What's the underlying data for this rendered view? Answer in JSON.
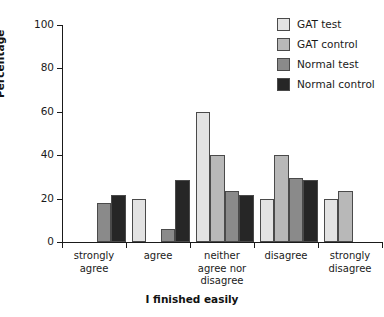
{
  "chart_data": {
    "type": "bar",
    "title": "",
    "xlabel": "I finished easily",
    "ylabel": "Percentage",
    "categories": [
      "strongly agree",
      "agree",
      "neither agree nor disagree",
      "disagree",
      "strongly disagree"
    ],
    "category_label_lines": [
      [
        "strongly",
        "agree"
      ],
      [
        "agree"
      ],
      [
        "neither",
        "agree nor",
        "disagree"
      ],
      [
        "disagree"
      ],
      [
        "strongly",
        "disagree"
      ]
    ],
    "series": [
      {
        "name": "GAT test",
        "color": "#e3e3e3",
        "values": [
          null,
          20,
          60,
          20,
          20
        ]
      },
      {
        "name": "GAT control",
        "color": "#b8b8b8",
        "values": [
          null,
          null,
          40,
          40,
          23.5
        ]
      },
      {
        "name": "Normal test",
        "color": "#8a8a8a",
        "values": [
          18,
          6,
          23.5,
          29.5,
          null
        ]
      },
      {
        "name": "Normal control",
        "color": "#262626",
        "values": [
          21.5,
          28.5,
          21.5,
          28.5,
          null
        ]
      }
    ],
    "ylim": [
      0,
      100
    ],
    "yticks": [
      0,
      20,
      40,
      60,
      80,
      100
    ],
    "ytick_labels": [
      "0",
      "20",
      "40",
      "60",
      "80",
      "100"
    ],
    "grid": false,
    "legend_position": "top-right",
    "axis_color": "#1a1a1a",
    "bar_edge_color": "#4a4a4a"
  }
}
